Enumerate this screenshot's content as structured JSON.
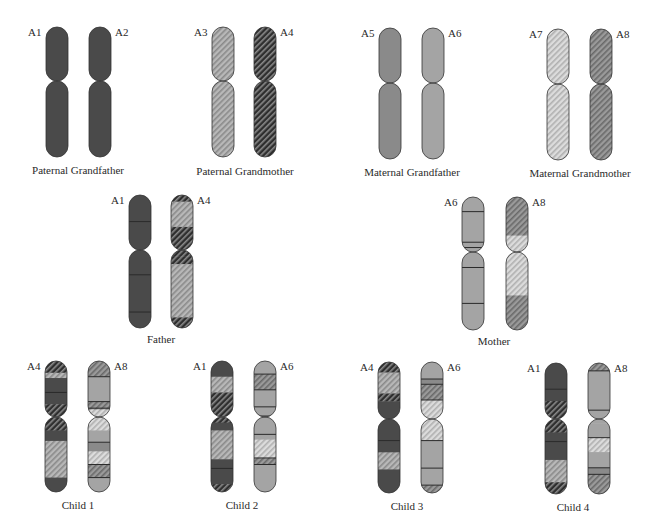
{
  "colors": {
    "dark": "#4a4a4a",
    "darkHatch": "#3a3a3a",
    "medium": "#8a8a8a",
    "mediumLight": "#a4a4a4",
    "light": "#b8b8b8",
    "veryLight": "#dcdcdc",
    "outline": "#333333"
  },
  "legend_fills": {
    "A1": "solid-dark",
    "A2": "solid-dark",
    "A3": "hatch-light",
    "A4": "hatch-dark",
    "A5": "solid-medium",
    "A6": "solid-light",
    "A7": "hatch-verylight",
    "A8": "hatch-medium"
  },
  "groups": [
    {
      "id": "paternal-grandfather",
      "caption": "Paternal Grandfather",
      "cap_x": 78,
      "cap_y": 164,
      "chromosomes": [
        {
          "label": "A1",
          "label_side": "left",
          "x": 46,
          "top": 27,
          "cen": 81,
          "bottom": 157,
          "segments": [
            {
              "from": 0,
              "to": 1,
              "fill": "A1"
            }
          ],
          "lines": []
        },
        {
          "label": "A2",
          "label_side": "right",
          "x": 89,
          "top": 27,
          "cen": 81,
          "bottom": 157,
          "segments": [
            {
              "from": 0,
              "to": 1,
              "fill": "A2"
            }
          ],
          "lines": []
        }
      ]
    },
    {
      "id": "paternal-grandmother",
      "caption": "Paternal Grandmother",
      "cap_x": 245,
      "cap_y": 165,
      "chromosomes": [
        {
          "label": "A3",
          "label_side": "left",
          "x": 212,
          "top": 27,
          "cen": 81,
          "bottom": 157,
          "segments": [
            {
              "from": 0,
              "to": 1,
              "fill": "A3"
            }
          ],
          "lines": []
        },
        {
          "label": "A4",
          "label_side": "right",
          "x": 254,
          "top": 27,
          "cen": 81,
          "bottom": 157,
          "segments": [
            {
              "from": 0,
              "to": 1,
              "fill": "A4"
            }
          ],
          "lines": []
        }
      ]
    },
    {
      "id": "maternal-grandfather",
      "caption": "Maternal Grandfather",
      "cap_x": 412,
      "cap_y": 166,
      "chromosomes": [
        {
          "label": "A5",
          "label_side": "left",
          "x": 379,
          "top": 28,
          "cen": 83,
          "bottom": 159,
          "segments": [
            {
              "from": 0,
              "to": 1,
              "fill": "A5"
            }
          ],
          "lines": []
        },
        {
          "label": "A6",
          "label_side": "right",
          "x": 422,
          "top": 28,
          "cen": 83,
          "bottom": 159,
          "segments": [
            {
              "from": 0,
              "to": 1,
              "fill": "A6"
            }
          ],
          "lines": []
        }
      ]
    },
    {
      "id": "maternal-grandmother",
      "caption": "Maternal Grandmother",
      "cap_x": 580,
      "cap_y": 167,
      "chromosomes": [
        {
          "label": "A7",
          "label_side": "left",
          "x": 547,
          "top": 29,
          "cen": 84,
          "bottom": 160,
          "segments": [
            {
              "from": 0,
              "to": 1,
              "fill": "A7"
            }
          ],
          "lines": []
        },
        {
          "label": "A8",
          "label_side": "right",
          "x": 590,
          "top": 29,
          "cen": 84,
          "bottom": 160,
          "segments": [
            {
              "from": 0,
              "to": 1,
              "fill": "A8"
            }
          ],
          "lines": []
        }
      ]
    },
    {
      "id": "father",
      "caption": "Father",
      "cap_x": 161,
      "cap_y": 333,
      "chromosomes": [
        {
          "label": "A1",
          "label_side": "left",
          "x": 129,
          "top": 195,
          "cen": 250,
          "bottom": 328,
          "segments": [
            {
              "from": 0,
              "to": 1,
              "fill": "A1"
            }
          ],
          "lines": [
            0.2,
            0.6,
            0.88
          ]
        },
        {
          "label": "A4",
          "label_side": "right",
          "x": 171,
          "top": 195,
          "cen": 250,
          "bottom": 328,
          "segments": [
            {
              "from": 0,
              "to": 0.05,
              "fill": "A4"
            },
            {
              "from": 0.05,
              "to": 0.24,
              "fill": "A3"
            },
            {
              "from": 0.24,
              "to": 0.46,
              "fill": "A4"
            },
            {
              "from": 0.46,
              "to": 0.52,
              "fill": "A4"
            },
            {
              "from": 0.52,
              "to": 0.92,
              "fill": "A3"
            },
            {
              "from": 0.92,
              "to": 1,
              "fill": "A4"
            }
          ],
          "lines": []
        }
      ]
    },
    {
      "id": "mother",
      "caption": "Mother",
      "cap_x": 494,
      "cap_y": 335,
      "chromosomes": [
        {
          "label": "A6",
          "label_side": "left",
          "x": 462,
          "top": 197,
          "cen": 252,
          "bottom": 330,
          "segments": [
            {
              "from": 0,
              "to": 1,
              "fill": "A6"
            }
          ],
          "lines": [
            0.11,
            0.34,
            0.38,
            0.53,
            0.8
          ]
        },
        {
          "label": "A8",
          "label_side": "right",
          "x": 506,
          "top": 197,
          "cen": 252,
          "bottom": 330,
          "segments": [
            {
              "from": 0,
              "to": 0.29,
              "fill": "A8"
            },
            {
              "from": 0.29,
              "to": 0.74,
              "fill": "A7"
            },
            {
              "from": 0.74,
              "to": 1,
              "fill": "A8"
            }
          ],
          "lines": []
        }
      ]
    },
    {
      "id": "child-1",
      "caption": "Child 1",
      "cap_x": 78,
      "cap_y": 499,
      "chromosomes": [
        {
          "label": "A4",
          "label_side": "left",
          "x": 45,
          "top": 361,
          "cen": 417,
          "bottom": 492,
          "segments": [
            {
              "from": 0,
              "to": 0.09,
              "fill": "A4"
            },
            {
              "from": 0.09,
              "to": 0.13,
              "fill": "A3"
            },
            {
              "from": 0.13,
              "to": 0.33,
              "fill": "A1"
            },
            {
              "from": 0.33,
              "to": 0.47,
              "fill": "A4"
            },
            {
              "from": 0.47,
              "to": 0.53,
              "fill": "A4"
            },
            {
              "from": 0.53,
              "to": 0.61,
              "fill": "A1"
            },
            {
              "from": 0.61,
              "to": 0.89,
              "fill": "A3"
            },
            {
              "from": 0.89,
              "to": 1,
              "fill": "A1"
            }
          ],
          "lines": [
            0.24
          ]
        },
        {
          "label": "A8",
          "label_side": "right",
          "x": 88,
          "top": 361,
          "cen": 417,
          "bottom": 492,
          "segments": [
            {
              "from": 0,
              "to": 0.12,
              "fill": "A8"
            },
            {
              "from": 0.12,
              "to": 0.31,
              "fill": "A6"
            },
            {
              "from": 0.31,
              "to": 0.37,
              "fill": "A8"
            },
            {
              "from": 0.37,
              "to": 0.47,
              "fill": "A7"
            },
            {
              "from": 0.47,
              "to": 0.53,
              "fill": "A7"
            },
            {
              "from": 0.53,
              "to": 0.62,
              "fill": "A6"
            },
            {
              "from": 0.62,
              "to": 0.69,
              "fill": "A5"
            },
            {
              "from": 0.69,
              "to": 0.79,
              "fill": "A7"
            },
            {
              "from": 0.79,
              "to": 0.89,
              "fill": "A8"
            },
            {
              "from": 0.89,
              "to": 1,
              "fill": "A6"
            }
          ],
          "lines": [
            0.12,
            0.31,
            0.36,
            0.62,
            0.79,
            0.89
          ]
        }
      ]
    },
    {
      "id": "child-2",
      "caption": "Child 2",
      "cap_x": 242,
      "cap_y": 499,
      "chromosomes": [
        {
          "label": "A1",
          "label_side": "left",
          "x": 211,
          "top": 361,
          "cen": 417,
          "bottom": 492,
          "segments": [
            {
              "from": 0,
              "to": 0.12,
              "fill": "A1"
            },
            {
              "from": 0.12,
              "to": 0.24,
              "fill": "A3"
            },
            {
              "from": 0.24,
              "to": 0.47,
              "fill": "A4"
            },
            {
              "from": 0.47,
              "to": 0.53,
              "fill": "A1"
            },
            {
              "from": 0.53,
              "to": 0.75,
              "fill": "A3"
            },
            {
              "from": 0.75,
              "to": 0.94,
              "fill": "A1"
            },
            {
              "from": 0.94,
              "to": 1,
              "fill": "A4"
            }
          ],
          "lines": [
            0.82
          ]
        },
        {
          "label": "A6",
          "label_side": "right",
          "x": 254,
          "top": 361,
          "cen": 417,
          "bottom": 492,
          "segments": [
            {
              "from": 0,
              "to": 0.1,
              "fill": "A6"
            },
            {
              "from": 0.1,
              "to": 0.22,
              "fill": "A8"
            },
            {
              "from": 0.22,
              "to": 0.6,
              "fill": "A6"
            },
            {
              "from": 0.6,
              "to": 0.74,
              "fill": "A7"
            },
            {
              "from": 0.74,
              "to": 0.79,
              "fill": "A8"
            },
            {
              "from": 0.79,
              "to": 1,
              "fill": "A6"
            }
          ],
          "lines": [
            0.1,
            0.22,
            0.35,
            0.42,
            0.56,
            0.74,
            0.79
          ]
        }
      ]
    },
    {
      "id": "child-3",
      "caption": "Child 3",
      "cap_x": 407,
      "cap_y": 500,
      "chromosomes": [
        {
          "label": "A4",
          "label_side": "left",
          "x": 378,
          "top": 362,
          "cen": 419,
          "bottom": 493,
          "segments": [
            {
              "from": 0,
              "to": 0.08,
              "fill": "A4"
            },
            {
              "from": 0.08,
              "to": 0.24,
              "fill": "A3"
            },
            {
              "from": 0.24,
              "to": 0.3,
              "fill": "A4"
            },
            {
              "from": 0.3,
              "to": 0.69,
              "fill": "A1"
            },
            {
              "from": 0.69,
              "to": 0.82,
              "fill": "A3"
            },
            {
              "from": 0.82,
              "to": 1,
              "fill": "A1"
            }
          ],
          "lines": [
            0.6
          ]
        },
        {
          "label": "A6",
          "label_side": "right",
          "x": 421,
          "top": 362,
          "cen": 419,
          "bottom": 493,
          "segments": [
            {
              "from": 0,
              "to": 0.13,
              "fill": "A6"
            },
            {
              "from": 0.13,
              "to": 0.17,
              "fill": "A5"
            },
            {
              "from": 0.17,
              "to": 0.29,
              "fill": "A8"
            },
            {
              "from": 0.29,
              "to": 0.6,
              "fill": "A7"
            },
            {
              "from": 0.6,
              "to": 0.94,
              "fill": "A6"
            },
            {
              "from": 0.94,
              "to": 1,
              "fill": "A8"
            }
          ],
          "lines": [
            0.13,
            0.17,
            0.29,
            0.6,
            0.81,
            0.94
          ]
        }
      ]
    },
    {
      "id": "child-4",
      "caption": "Child 4",
      "cap_x": 573,
      "cap_y": 501,
      "chromosomes": [
        {
          "label": "A1",
          "label_side": "left",
          "x": 545,
          "top": 363,
          "cen": 419,
          "bottom": 494,
          "segments": [
            {
              "from": 0,
              "to": 0.29,
              "fill": "A1"
            },
            {
              "from": 0.29,
              "to": 0.47,
              "fill": "A4"
            },
            {
              "from": 0.47,
              "to": 0.53,
              "fill": "A4"
            },
            {
              "from": 0.53,
              "to": 0.74,
              "fill": "A1"
            },
            {
              "from": 0.74,
              "to": 0.91,
              "fill": "A3"
            },
            {
              "from": 0.91,
              "to": 1,
              "fill": "A4"
            }
          ],
          "lines": [
            0.2,
            0.6
          ]
        },
        {
          "label": "A8",
          "label_side": "right",
          "x": 588,
          "top": 363,
          "cen": 419,
          "bottom": 494,
          "segments": [
            {
              "from": 0,
              "to": 0.06,
              "fill": "A8"
            },
            {
              "from": 0.06,
              "to": 0.46,
              "fill": "A6"
            },
            {
              "from": 0.46,
              "to": 0.57,
              "fill": "A6"
            },
            {
              "from": 0.57,
              "to": 0.68,
              "fill": "A7"
            },
            {
              "from": 0.68,
              "to": 0.8,
              "fill": "A6"
            },
            {
              "from": 0.8,
              "to": 0.85,
              "fill": "A5"
            },
            {
              "from": 0.85,
              "to": 1,
              "fill": "A8"
            }
          ],
          "lines": [
            0.06,
            0.36,
            0.57,
            0.8,
            0.85
          ]
        }
      ]
    }
  ]
}
